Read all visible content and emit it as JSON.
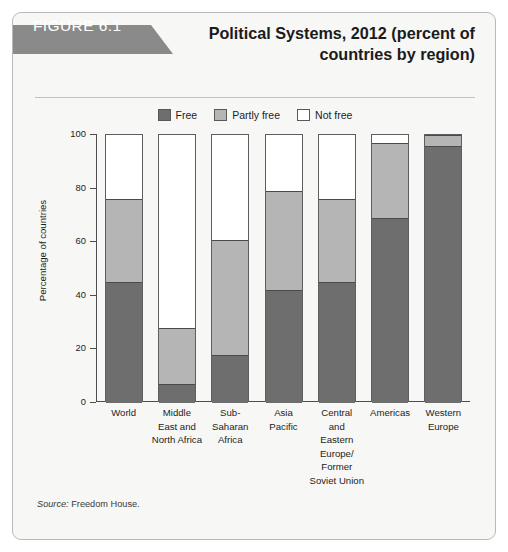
{
  "figure": {
    "tag": "FIGURE 6.1",
    "title": "Political Systems, 2012 (percent of countries by region)",
    "source_word": "Source:",
    "source_text": " Freedom House."
  },
  "colors": {
    "free": "#6e6e6e",
    "partly_free": "#b5b5b5",
    "not_free": "#ffffff",
    "outline": "#5e5e5e",
    "tag_bg": "#8a8a8a",
    "panel_bg": "#f7f7f5"
  },
  "legend": {
    "items": [
      {
        "label": "Free",
        "color": "#6e6e6e"
      },
      {
        "label": "Partly free",
        "color": "#b5b5b5"
      },
      {
        "label": "Not free",
        "color": "#ffffff"
      }
    ]
  },
  "axis": {
    "y_title": "Percentage of countries",
    "y_ticks": [
      "100",
      "80",
      "60",
      "40",
      "20",
      "0"
    ]
  },
  "chart_data": {
    "type": "bar",
    "subtype": "stacked-vertical-100",
    "title": "Political Systems, 2012 (percent of countries by region)",
    "xlabel": "",
    "ylabel": "Percentage of countries",
    "ylim": [
      0,
      100
    ],
    "yticks": [
      0,
      20,
      40,
      60,
      80,
      100
    ],
    "grid": false,
    "legend_position": "top-center",
    "source": "Source: Freedom House.",
    "categories": [
      "World",
      "Middle East and North Africa",
      "Sub-Saharan Africa",
      "Asia Pacific",
      "Central and Eastern Europe/ Former Soviet Union",
      "Americas",
      "Western Europe"
    ],
    "category_label_lines": [
      [
        "World"
      ],
      [
        "Middle",
        "East and",
        "North Africa"
      ],
      [
        "Sub-",
        "Saharan",
        "Africa"
      ],
      [
        "Asia",
        "Pacific"
      ],
      [
        "Central",
        "and",
        "Eastern",
        "Europe/",
        "Former",
        "Soviet Union"
      ],
      [
        "Americas"
      ],
      [
        "Western",
        "Europe"
      ]
    ],
    "series": [
      {
        "name": "Free",
        "color": "#6e6e6e",
        "values": [
          45,
          7,
          18,
          42,
          45,
          69,
          96
        ]
      },
      {
        "name": "Partly free",
        "color": "#b5b5b5",
        "values": [
          31,
          21,
          43,
          37,
          31,
          28,
          4
        ]
      },
      {
        "name": "Not free",
        "color": "#ffffff",
        "values": [
          24,
          72,
          39,
          21,
          24,
          3,
          0
        ]
      }
    ],
    "cumulative_tops": {
      "free": [
        45,
        7,
        18,
        42,
        45,
        69,
        96
      ],
      "partly_free": [
        76,
        28,
        61,
        79,
        76,
        97,
        100
      ]
    }
  }
}
